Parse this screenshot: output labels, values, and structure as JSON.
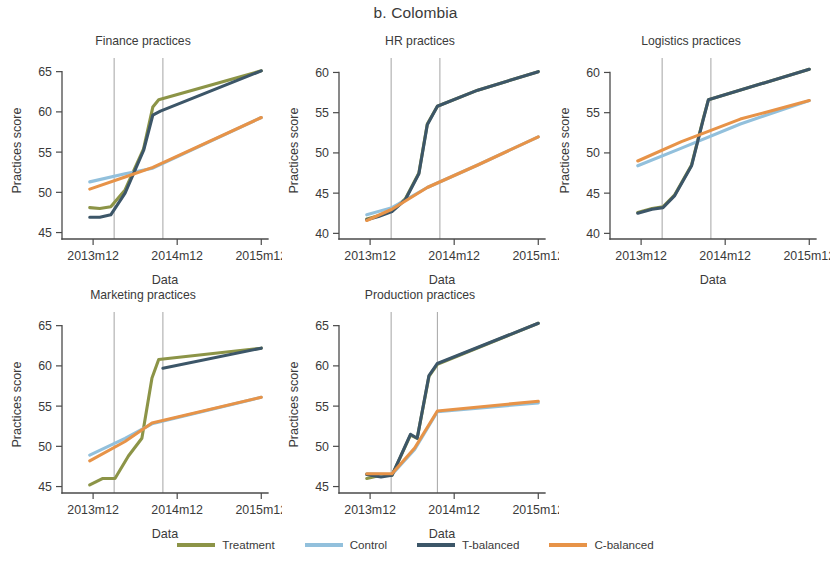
{
  "figure": {
    "title": "b. Colombia",
    "xlabel": "Data",
    "ylabel": "Practices score",
    "xticks": [
      "2013m12",
      "2014m12",
      "2015m12"
    ]
  },
  "legend": {
    "items": [
      {
        "label": "Treatment",
        "color": "#8c9447"
      },
      {
        "label": "Control",
        "color": "#92c0dc"
      },
      {
        "label": "T-balanced",
        "color": "#3c5668"
      },
      {
        "label": "C-balanced",
        "color": "#e79348"
      }
    ]
  },
  "colors": {
    "treatment": "#8c9447",
    "control": "#92c0dc",
    "t_balanced": "#3c5668",
    "c_balanced": "#e79348",
    "axis": "#4a4a4a",
    "vline": "#9a9a9a",
    "text": "#3a3a3a"
  },
  "chart_data": [
    {
      "id": "finance",
      "type": "line",
      "title": "Finance practices",
      "xlabel": "Data",
      "ylabel": "Practices score",
      "xlim": [
        2013.55,
        2016.0
      ],
      "ylim": [
        44.2,
        66.2
      ],
      "yticks": [
        45,
        50,
        55,
        60,
        65
      ],
      "xticks": [
        2013.92,
        2014.92,
        2015.92
      ],
      "xticklabels": [
        "2013m12",
        "2014m12",
        "2015m12"
      ],
      "vlines": [
        2014.17,
        2014.75
      ],
      "grid": false,
      "legend_position": "bottom",
      "series": [
        {
          "name": "Treatment",
          "color": "#8c9447",
          "x": [
            2013.88,
            2014.0,
            2014.13,
            2014.3,
            2014.52,
            2014.63,
            2014.7,
            2015.92
          ],
          "y": [
            48.1,
            48.0,
            48.2,
            50.3,
            55.4,
            60.6,
            61.5,
            65.1
          ]
        },
        {
          "name": "Control",
          "color": "#92c0dc",
          "x": [
            2013.88,
            2014.3,
            2014.63,
            2015.92
          ],
          "y": [
            51.3,
            52.3,
            53.0,
            59.3
          ]
        },
        {
          "name": "T-balanced",
          "color": "#3c5668",
          "x": [
            2013.88,
            2014.0,
            2014.13,
            2014.3,
            2014.52,
            2014.63,
            2014.72,
            2015.92
          ],
          "y": [
            46.9,
            46.9,
            47.2,
            49.9,
            55.2,
            59.6,
            60.1,
            65.1
          ]
        },
        {
          "name": "C-balanced",
          "color": "#e79348",
          "x": [
            2013.88,
            2014.3,
            2014.63,
            2015.92
          ],
          "y": [
            50.4,
            51.9,
            53.1,
            59.3
          ]
        }
      ]
    },
    {
      "id": "hr",
      "type": "line",
      "title": "HR practices",
      "xlabel": "Data",
      "ylabel": "Practices score",
      "xlim": [
        2013.55,
        2016.0
      ],
      "ylim": [
        39.3,
        61.3
      ],
      "yticks": [
        40,
        45,
        50,
        55,
        60
      ],
      "xticks": [
        2013.92,
        2014.92,
        2015.92
      ],
      "xticklabels": [
        "2013m12",
        "2014m12",
        "2015m12"
      ],
      "vlines": [
        2014.17,
        2014.75
      ],
      "grid": false,
      "legend_position": "bottom",
      "series": [
        {
          "name": "Treatment",
          "color": "#8c9447",
          "x": [
            2013.88,
            2014.02,
            2014.18,
            2014.34,
            2014.5,
            2014.6,
            2014.72,
            2015.2,
            2015.92
          ],
          "y": [
            41.8,
            42.2,
            42.8,
            44.3,
            47.5,
            53.6,
            55.8,
            57.8,
            60.1
          ]
        },
        {
          "name": "Control",
          "color": "#92c0dc",
          "x": [
            2013.88,
            2014.18,
            2014.6,
            2015.2,
            2015.92
          ],
          "y": [
            42.3,
            43.2,
            45.7,
            48.5,
            52.0
          ]
        },
        {
          "name": "T-balanced",
          "color": "#3c5668",
          "x": [
            2013.88,
            2014.02,
            2014.18,
            2014.34,
            2014.5,
            2014.6,
            2014.72,
            2015.2,
            2015.92
          ],
          "y": [
            41.7,
            42.1,
            42.7,
            44.2,
            47.4,
            53.5,
            55.8,
            57.8,
            60.1
          ]
        },
        {
          "name": "C-balanced",
          "color": "#e79348",
          "x": [
            2013.88,
            2014.18,
            2014.6,
            2015.2,
            2015.92
          ],
          "y": [
            41.6,
            43.0,
            45.7,
            48.5,
            52.0
          ]
        }
      ]
    },
    {
      "id": "logistics",
      "type": "line",
      "title": "Logistics practices",
      "xlabel": "Data",
      "ylabel": "Practices score",
      "xlim": [
        2013.55,
        2016.0
      ],
      "ylim": [
        39.3,
        61.3
      ],
      "yticks": [
        40,
        45,
        50,
        55,
        60
      ],
      "xticks": [
        2013.92,
        2014.92,
        2015.92
      ],
      "xticklabels": [
        "2013m12",
        "2014m12",
        "2015m12"
      ],
      "vlines": [
        2014.17,
        2014.75
      ],
      "grid": false,
      "legend_position": "bottom",
      "series": [
        {
          "name": "Treatment",
          "color": "#8c9447",
          "x": [
            2013.88,
            2014.05,
            2014.18,
            2014.32,
            2014.52,
            2014.66,
            2014.72,
            2015.92
          ],
          "y": [
            42.6,
            43.1,
            43.3,
            44.8,
            48.5,
            54.3,
            56.6,
            60.4
          ]
        },
        {
          "name": "Control",
          "color": "#92c0dc",
          "x": [
            2013.88,
            2014.4,
            2015.1,
            2015.92
          ],
          "y": [
            48.4,
            50.6,
            53.6,
            56.5
          ]
        },
        {
          "name": "T-balanced",
          "color": "#3c5668",
          "x": [
            2013.88,
            2014.05,
            2014.18,
            2014.32,
            2014.52,
            2014.66,
            2014.72,
            2015.92
          ],
          "y": [
            42.5,
            43.0,
            43.2,
            44.7,
            48.4,
            54.2,
            56.6,
            60.4
          ]
        },
        {
          "name": "C-balanced",
          "color": "#e79348",
          "x": [
            2013.88,
            2014.4,
            2015.1,
            2015.92
          ],
          "y": [
            49.0,
            51.4,
            54.2,
            56.5
          ]
        }
      ]
    },
    {
      "id": "marketing",
      "type": "line",
      "title": "Marketing practices",
      "xlabel": "Data",
      "ylabel": "Practices score",
      "xlim": [
        2013.55,
        2016.0
      ],
      "ylim": [
        44.2,
        66.2
      ],
      "yticks": [
        45,
        50,
        55,
        60,
        65
      ],
      "xticks": [
        2013.92,
        2014.92,
        2015.92
      ],
      "xticklabels": [
        "2013m12",
        "2014m12",
        "2015m12"
      ],
      "vlines": [
        2014.17,
        2014.75
      ],
      "grid": false,
      "legend_position": "bottom",
      "series": [
        {
          "name": "Treatment",
          "color": "#8c9447",
          "x": [
            2013.88,
            2014.03,
            2014.18,
            2014.34,
            2014.5,
            2014.62,
            2014.7,
            2015.92
          ],
          "y": [
            45.2,
            46.0,
            46.0,
            48.8,
            51.0,
            58.5,
            60.8,
            62.2
          ]
        },
        {
          "name": "Control",
          "color": "#92c0dc",
          "x": [
            2013.88,
            2014.3,
            2014.62,
            2015.92
          ],
          "y": [
            48.9,
            51.0,
            52.8,
            56.1
          ]
        },
        {
          "name": "T-balanced",
          "color": "#3c5668",
          "x": [
            2014.75,
            2015.92
          ],
          "y": [
            59.7,
            62.2
          ]
        },
        {
          "name": "C-balanced",
          "color": "#e79348",
          "x": [
            2013.88,
            2014.3,
            2014.62,
            2015.92
          ],
          "y": [
            48.2,
            50.6,
            52.9,
            56.1
          ]
        }
      ]
    },
    {
      "id": "production",
      "type": "line",
      "title": "Production practices",
      "xlabel": "Data",
      "ylabel": "Practices score",
      "xlim": [
        2013.55,
        2016.0
      ],
      "ylim": [
        44.2,
        66.2
      ],
      "yticks": [
        45,
        50,
        55,
        60,
        65
      ],
      "xticks": [
        2013.92,
        2014.92,
        2015.92
      ],
      "xticklabels": [
        "2013m12",
        "2014m12",
        "2015m12"
      ],
      "vlines": [
        2014.17,
        2014.72
      ],
      "grid": false,
      "legend_position": "bottom",
      "series": [
        {
          "name": "Treatment",
          "color": "#8c9447",
          "x": [
            2013.88,
            2014.05,
            2014.18,
            2014.4,
            2014.48,
            2014.62,
            2014.72,
            2015.92
          ],
          "y": [
            46.0,
            46.4,
            46.4,
            51.4,
            51.0,
            58.7,
            60.2,
            65.3
          ]
        },
        {
          "name": "Control",
          "color": "#92c0dc",
          "x": [
            2013.88,
            2014.18,
            2014.45,
            2014.72,
            2015.92
          ],
          "y": [
            46.6,
            46.5,
            49.6,
            54.3,
            55.4
          ]
        },
        {
          "name": "T-balanced",
          "color": "#3c5668",
          "x": [
            2013.88,
            2014.05,
            2014.18,
            2014.4,
            2014.48,
            2014.62,
            2014.72,
            2015.92
          ],
          "y": [
            46.5,
            46.2,
            46.4,
            51.5,
            51.0,
            58.8,
            60.3,
            65.3
          ]
        },
        {
          "name": "C-balanced",
          "color": "#e79348",
          "x": [
            2013.88,
            2014.18,
            2014.45,
            2014.72,
            2015.92
          ],
          "y": [
            46.6,
            46.6,
            49.8,
            54.4,
            55.6
          ]
        }
      ]
    }
  ]
}
